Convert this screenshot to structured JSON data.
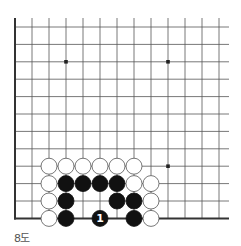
{
  "diagram": {
    "caption": "8도",
    "board": {
      "cols": 13,
      "rows": 12,
      "origin_x": 15,
      "origin_y": 27,
      "spacing_x": 17.0,
      "spacing_y": 17.4,
      "line_color": "#555555",
      "edge_color": "#333333",
      "edges": [
        "left",
        "bottom"
      ],
      "star_points": [
        [
          3,
          2
        ],
        [
          9,
          2
        ],
        [
          9,
          8
        ]
      ]
    },
    "stones": [
      {
        "color": "white",
        "col": 2,
        "row": 8
      },
      {
        "color": "white",
        "col": 3,
        "row": 8
      },
      {
        "color": "white",
        "col": 4,
        "row": 8
      },
      {
        "color": "white",
        "col": 5,
        "row": 8
      },
      {
        "color": "white",
        "col": 6,
        "row": 8
      },
      {
        "color": "white",
        "col": 7,
        "row": 8
      },
      {
        "color": "white",
        "col": 2,
        "row": 9
      },
      {
        "color": "black",
        "col": 3,
        "row": 9
      },
      {
        "color": "black",
        "col": 4,
        "row": 9
      },
      {
        "color": "black",
        "col": 5,
        "row": 9
      },
      {
        "color": "black",
        "col": 6,
        "row": 9
      },
      {
        "color": "white",
        "col": 7,
        "row": 9
      },
      {
        "color": "white",
        "col": 8,
        "row": 9
      },
      {
        "color": "white",
        "col": 2,
        "row": 10
      },
      {
        "color": "black",
        "col": 3,
        "row": 10
      },
      {
        "color": "black",
        "col": 6,
        "row": 10
      },
      {
        "color": "black",
        "col": 7,
        "row": 10
      },
      {
        "color": "white",
        "col": 8,
        "row": 10
      },
      {
        "color": "white",
        "col": 2,
        "row": 11
      },
      {
        "color": "black",
        "col": 3,
        "row": 11
      },
      {
        "color": "black",
        "col": 5,
        "row": 11,
        "label": "1"
      },
      {
        "color": "black",
        "col": 7,
        "row": 11
      },
      {
        "color": "white",
        "col": 8,
        "row": 11
      }
    ]
  }
}
